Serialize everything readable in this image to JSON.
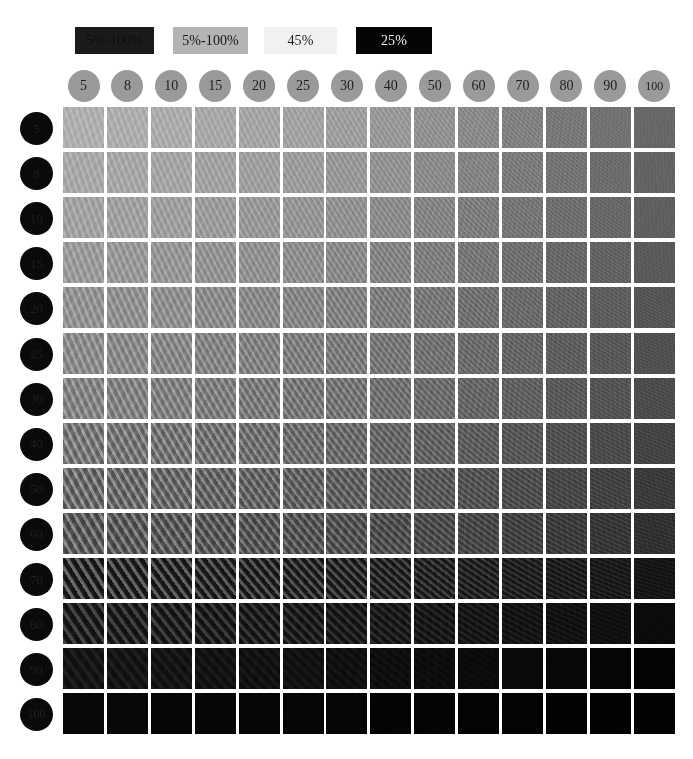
{
  "legend": {
    "items": [
      {
        "label": "5%-100%",
        "bg": "#1b1b1b",
        "fg": "#0e0e0e"
      },
      {
        "label": "5%-100%",
        "bg": "#b4b4b4",
        "fg": "#161616"
      },
      {
        "label": "45%",
        "bg": "#f1f1f1",
        "fg": "#1b1b1b"
      },
      {
        "label": "25%",
        "bg": "#050505",
        "fg": "#f2f2f2"
      }
    ]
  },
  "axes": {
    "columns": [
      "5",
      "8",
      "10",
      "15",
      "20",
      "25",
      "30",
      "40",
      "50",
      "60",
      "70",
      "80",
      "90",
      "100"
    ],
    "rows": [
      "5",
      "8",
      "10",
      "15",
      "20",
      "25",
      "30",
      "40",
      "50",
      "60",
      "70",
      "80",
      "90",
      "100"
    ],
    "column_header_color": "#9a9a9a",
    "row_header_color": "#0a0a0a"
  },
  "chart_data": {
    "type": "heatmap",
    "title": "",
    "xlabel": "",
    "ylabel": "",
    "grid": false,
    "legend_position": "top",
    "categories": [
      "5",
      "8",
      "10",
      "15",
      "20",
      "25",
      "30",
      "40",
      "50",
      "60",
      "70",
      "80",
      "90",
      "100"
    ],
    "y_categories": [
      "5",
      "8",
      "10",
      "15",
      "20",
      "25",
      "30",
      "40",
      "50",
      "60",
      "70",
      "80",
      "90",
      "100"
    ],
    "value_label": "patch gray level (0-255)",
    "values": [
      [
        178,
        176,
        174,
        171,
        168,
        165,
        161,
        155,
        148,
        140,
        131,
        122,
        115,
        104
      ],
      [
        172,
        170,
        168,
        165,
        162,
        159,
        155,
        149,
        142,
        134,
        125,
        117,
        110,
        100
      ],
      [
        166,
        164,
        162,
        159,
        156,
        153,
        149,
        143,
        136,
        128,
        120,
        112,
        105,
        96
      ],
      [
        159,
        157,
        155,
        152,
        149,
        146,
        142,
        136,
        130,
        122,
        114,
        106,
        100,
        91
      ],
      [
        152,
        150,
        148,
        145,
        142,
        139,
        135,
        130,
        124,
        116,
        109,
        101,
        95,
        86
      ],
      [
        146,
        144,
        142,
        139,
        136,
        133,
        129,
        124,
        118,
        111,
        104,
        96,
        90,
        81
      ],
      [
        140,
        138,
        136,
        133,
        130,
        127,
        124,
        118,
        113,
        106,
        99,
        92,
        86,
        77
      ],
      [
        130,
        128,
        126,
        123,
        120,
        117,
        114,
        109,
        104,
        97,
        90,
        83,
        77,
        69
      ],
      [
        119,
        117,
        115,
        112,
        110,
        107,
        104,
        99,
        94,
        88,
        81,
        74,
        68,
        60
      ],
      [
        105,
        103,
        101,
        99,
        96,
        94,
        91,
        86,
        82,
        76,
        70,
        63,
        57,
        50
      ],
      [
        63,
        61,
        59,
        57,
        55,
        53,
        51,
        48,
        45,
        41,
        37,
        33,
        29,
        23
      ],
      [
        44,
        42,
        41,
        39,
        37,
        35,
        33,
        31,
        28,
        25,
        22,
        19,
        16,
        11
      ],
      [
        24,
        23,
        22,
        20,
        19,
        18,
        17,
        15,
        13,
        11,
        9,
        7,
        5,
        3
      ],
      [
        7,
        7,
        6,
        6,
        5,
        5,
        5,
        4,
        4,
        3,
        3,
        2,
        2,
        2
      ]
    ],
    "moire": [
      [
        0.22,
        0.22,
        0.22,
        0.21,
        0.21,
        0.2,
        0.2,
        0.19,
        0.18,
        0.17,
        0.16,
        0.15,
        0.14,
        0.12
      ],
      [
        0.24,
        0.24,
        0.23,
        0.23,
        0.22,
        0.22,
        0.21,
        0.2,
        0.19,
        0.18,
        0.17,
        0.16,
        0.15,
        0.13
      ],
      [
        0.26,
        0.26,
        0.25,
        0.25,
        0.24,
        0.23,
        0.23,
        0.22,
        0.21,
        0.2,
        0.18,
        0.17,
        0.16,
        0.14
      ],
      [
        0.28,
        0.28,
        0.27,
        0.27,
        0.26,
        0.25,
        0.25,
        0.24,
        0.22,
        0.21,
        0.2,
        0.18,
        0.17,
        0.15
      ],
      [
        0.3,
        0.3,
        0.29,
        0.29,
        0.28,
        0.27,
        0.27,
        0.25,
        0.24,
        0.23,
        0.21,
        0.2,
        0.18,
        0.16
      ],
      [
        0.33,
        0.32,
        0.32,
        0.31,
        0.3,
        0.3,
        0.29,
        0.27,
        0.26,
        0.24,
        0.23,
        0.21,
        0.2,
        0.17
      ],
      [
        0.35,
        0.35,
        0.34,
        0.33,
        0.33,
        0.32,
        0.31,
        0.29,
        0.28,
        0.26,
        0.24,
        0.23,
        0.21,
        0.18
      ],
      [
        0.4,
        0.39,
        0.39,
        0.38,
        0.37,
        0.36,
        0.35,
        0.33,
        0.32,
        0.3,
        0.28,
        0.26,
        0.24,
        0.21
      ],
      [
        0.46,
        0.45,
        0.44,
        0.43,
        0.42,
        0.41,
        0.4,
        0.38,
        0.36,
        0.34,
        0.32,
        0.29,
        0.27,
        0.23
      ],
      [
        0.52,
        0.51,
        0.5,
        0.49,
        0.48,
        0.47,
        0.46,
        0.43,
        0.41,
        0.38,
        0.36,
        0.33,
        0.3,
        0.26
      ],
      [
        0.88,
        0.87,
        0.86,
        0.84,
        0.83,
        0.81,
        0.79,
        0.75,
        0.71,
        0.66,
        0.61,
        0.55,
        0.49,
        0.4
      ],
      [
        0.8,
        0.79,
        0.78,
        0.76,
        0.74,
        0.72,
        0.7,
        0.66,
        0.62,
        0.57,
        0.52,
        0.46,
        0.4,
        0.3
      ],
      [
        0.52,
        0.51,
        0.5,
        0.48,
        0.47,
        0.45,
        0.43,
        0.4,
        0.36,
        0.32,
        0.28,
        0.23,
        0.18,
        0.1
      ],
      [
        0.1,
        0.1,
        0.09,
        0.09,
        0.08,
        0.08,
        0.07,
        0.06,
        0.05,
        0.04,
        0.04,
        0.03,
        0.02,
        0.02
      ]
    ],
    "moire_angle": [
      [
        72,
        70,
        68,
        66,
        64,
        62,
        60,
        56,
        52,
        48,
        44,
        40,
        36,
        30
      ],
      [
        71,
        69,
        67,
        65,
        63,
        61,
        59,
        55,
        51,
        47,
        43,
        39,
        35,
        29
      ],
      [
        70,
        68,
        66,
        64,
        62,
        60,
        58,
        54,
        50,
        46,
        42,
        38,
        34,
        28
      ],
      [
        69,
        67,
        65,
        63,
        61,
        59,
        57,
        53,
        49,
        45,
        41,
        37,
        33,
        27
      ],
      [
        68,
        66,
        64,
        62,
        60,
        58,
        56,
        52,
        48,
        44,
        40,
        36,
        32,
        26
      ],
      [
        67,
        65,
        63,
        61,
        59,
        57,
        55,
        51,
        47,
        43,
        39,
        35,
        31,
        25
      ],
      [
        66,
        64,
        62,
        60,
        58,
        56,
        54,
        50,
        46,
        42,
        38,
        34,
        30,
        24
      ],
      [
        64,
        62,
        60,
        58,
        56,
        54,
        52,
        48,
        44,
        40,
        36,
        32,
        28,
        22
      ],
      [
        62,
        60,
        58,
        56,
        54,
        52,
        50,
        46,
        42,
        38,
        34,
        30,
        26,
        20
      ],
      [
        60,
        58,
        56,
        54,
        52,
        50,
        48,
        44,
        40,
        36,
        32,
        28,
        24,
        18
      ],
      [
        58,
        56,
        54,
        52,
        50,
        48,
        46,
        42,
        38,
        34,
        30,
        26,
        22,
        16
      ],
      [
        56,
        54,
        52,
        50,
        48,
        46,
        44,
        40,
        36,
        32,
        28,
        24,
        20,
        14
      ],
      [
        54,
        52,
        50,
        48,
        46,
        44,
        42,
        38,
        34,
        30,
        26,
        22,
        18,
        12
      ],
      [
        52,
        50,
        48,
        46,
        44,
        42,
        40,
        36,
        32,
        28,
        24,
        20,
        16,
        10
      ]
    ],
    "moire_period": [
      [
        5.5,
        5.3,
        5.1,
        4.9,
        4.7,
        4.5,
        4.3,
        4.0,
        3.7,
        3.5,
        3.2,
        3.0,
        2.8,
        2.5
      ],
      [
        5.6,
        5.4,
        5.2,
        5.0,
        4.8,
        4.6,
        4.4,
        4.1,
        3.8,
        3.6,
        3.3,
        3.1,
        2.9,
        2.6
      ],
      [
        5.7,
        5.5,
        5.3,
        5.1,
        4.9,
        4.7,
        4.5,
        4.2,
        3.9,
        3.7,
        3.4,
        3.2,
        3.0,
        2.7
      ],
      [
        5.8,
        5.6,
        5.4,
        5.2,
        5.0,
        4.8,
        4.6,
        4.3,
        4.0,
        3.8,
        3.5,
        3.3,
        3.1,
        2.8
      ],
      [
        6.0,
        5.8,
        5.6,
        5.4,
        5.2,
        5.0,
        4.8,
        4.5,
        4.2,
        3.9,
        3.6,
        3.4,
        3.2,
        2.9
      ],
      [
        6.2,
        6.0,
        5.8,
        5.6,
        5.4,
        5.2,
        5.0,
        4.6,
        4.3,
        4.0,
        3.7,
        3.5,
        3.3,
        3.0
      ],
      [
        6.4,
        6.2,
        6.0,
        5.8,
        5.6,
        5.4,
        5.2,
        4.8,
        4.5,
        4.2,
        3.9,
        3.6,
        3.4,
        3.1
      ],
      [
        6.7,
        6.5,
        6.3,
        6.1,
        5.9,
        5.6,
        5.4,
        5.0,
        4.7,
        4.4,
        4.1,
        3.8,
        3.5,
        3.2
      ],
      [
        7.0,
        6.8,
        6.6,
        6.3,
        6.1,
        5.9,
        5.7,
        5.3,
        4.9,
        4.6,
        4.3,
        4.0,
        3.7,
        3.3
      ],
      [
        7.4,
        7.2,
        6.9,
        6.7,
        6.4,
        6.2,
        6.0,
        5.6,
        5.2,
        4.8,
        4.5,
        4.2,
        3.9,
        3.5
      ],
      [
        8.0,
        7.7,
        7.5,
        7.2,
        7.0,
        6.7,
        6.5,
        6.0,
        5.6,
        5.2,
        4.8,
        4.5,
        4.1,
        3.7
      ],
      [
        8.4,
        8.1,
        7.9,
        7.6,
        7.3,
        7.0,
        6.8,
        6.3,
        5.9,
        5.4,
        5.0,
        4.7,
        4.3,
        3.8
      ],
      [
        8.8,
        8.5,
        8.2,
        7.9,
        7.6,
        7.3,
        7.1,
        6.6,
        6.1,
        5.6,
        5.2,
        4.8,
        4.4,
        3.9
      ],
      [
        9.0,
        8.7,
        8.4,
        8.1,
        7.8,
        7.5,
        7.2,
        6.7,
        6.2,
        5.7,
        5.3,
        4.9,
        4.5,
        4.0
      ]
    ]
  },
  "layout": {
    "matrix_left": 63,
    "matrix_top": 107,
    "cell_pitch_x": 43.9,
    "cell_pitch_y": 45.1,
    "cell_size": 41
  },
  "footer": {
    "mark": ""
  }
}
